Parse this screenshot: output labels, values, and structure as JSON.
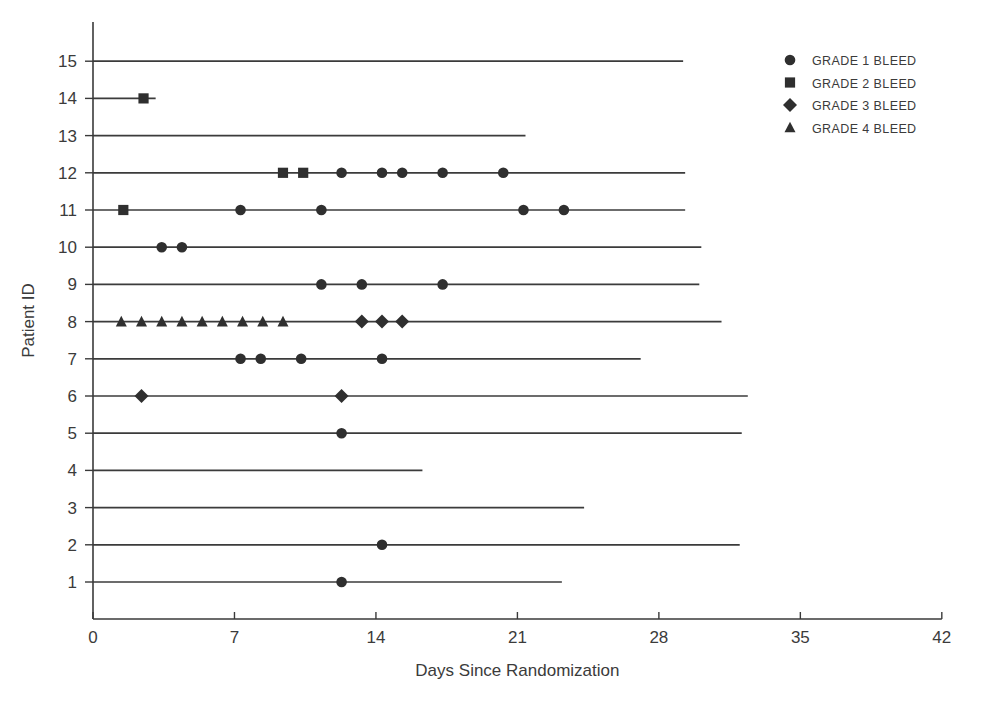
{
  "chart_data": {
    "type": "scatter",
    "title": "",
    "xlabel": "Days Since Randomization",
    "ylabel": "Patient ID",
    "xlim": [
      0,
      42
    ],
    "ylim": [
      0.5,
      15.5
    ],
    "xticks": [
      0,
      7,
      14,
      21,
      28,
      35,
      42
    ],
    "xtick_labels": [
      "0",
      "7",
      "14",
      "21",
      "28",
      "35",
      "42"
    ],
    "yticks": [
      1,
      2,
      3,
      4,
      5,
      6,
      7,
      8,
      9,
      10,
      11,
      12,
      13,
      14,
      15
    ],
    "ytick_labels": [
      "1",
      "2",
      "3",
      "4",
      "5",
      "6",
      "7",
      "8",
      "9",
      "10",
      "11",
      "12",
      "13",
      "14",
      "15"
    ],
    "grid": false,
    "legend_position": "top-right",
    "legend": [
      {
        "label": "GRADE 1 BLEED",
        "marker": "circle"
      },
      {
        "label": "GRADE 2 BLEED",
        "marker": "square"
      },
      {
        "label": "GRADE 3 BLEED",
        "marker": "diamond"
      },
      {
        "label": "GRADE 4 BLEED",
        "marker": "triangle"
      }
    ],
    "series": [
      {
        "name": "Patient 15",
        "patient_id": 15,
        "follow_up_start": 0,
        "follow_up_end": 29.2,
        "events": []
      },
      {
        "name": "Patient 14",
        "patient_id": 14,
        "follow_up_start": 0,
        "follow_up_end": 3.1,
        "events": [
          {
            "day": 2.5,
            "marker": "square",
            "grade": 2
          }
        ]
      },
      {
        "name": "Patient 13",
        "patient_id": 13,
        "follow_up_start": 0,
        "follow_up_end": 21.4,
        "events": []
      },
      {
        "name": "Patient 12",
        "patient_id": 12,
        "follow_up_start": 0,
        "follow_up_end": 29.3,
        "events": [
          {
            "day": 9.4,
            "marker": "square",
            "grade": 2
          },
          {
            "day": 10.4,
            "marker": "square",
            "grade": 2
          },
          {
            "day": 12.3,
            "marker": "circle",
            "grade": 1
          },
          {
            "day": 14.3,
            "marker": "circle",
            "grade": 1
          },
          {
            "day": 15.3,
            "marker": "circle",
            "grade": 1
          },
          {
            "day": 17.3,
            "marker": "circle",
            "grade": 1
          },
          {
            "day": 20.3,
            "marker": "circle",
            "grade": 1
          }
        ]
      },
      {
        "name": "Patient 11",
        "patient_id": 11,
        "follow_up_start": 0,
        "follow_up_end": 29.3,
        "events": [
          {
            "day": 1.5,
            "marker": "square",
            "grade": 2
          },
          {
            "day": 7.3,
            "marker": "circle",
            "grade": 1
          },
          {
            "day": 11.3,
            "marker": "circle",
            "grade": 1
          },
          {
            "day": 21.3,
            "marker": "circle",
            "grade": 1
          },
          {
            "day": 23.3,
            "marker": "circle",
            "grade": 1
          }
        ]
      },
      {
        "name": "Patient 10",
        "patient_id": 10,
        "follow_up_start": 0,
        "follow_up_end": 30.1,
        "events": [
          {
            "day": 3.4,
            "marker": "circle",
            "grade": 1
          },
          {
            "day": 4.4,
            "marker": "circle",
            "grade": 1
          }
        ]
      },
      {
        "name": "Patient 9",
        "patient_id": 9,
        "follow_up_start": 0,
        "follow_up_end": 30.0,
        "events": [
          {
            "day": 11.3,
            "marker": "circle",
            "grade": 1
          },
          {
            "day": 13.3,
            "marker": "circle",
            "grade": 1
          },
          {
            "day": 17.3,
            "marker": "circle",
            "grade": 1
          }
        ]
      },
      {
        "name": "Patient 8",
        "patient_id": 8,
        "follow_up_start": 0,
        "follow_up_end": 31.1,
        "events": [
          {
            "day": 1.4,
            "marker": "triangle",
            "grade": 4
          },
          {
            "day": 2.4,
            "marker": "triangle",
            "grade": 4
          },
          {
            "day": 3.4,
            "marker": "triangle",
            "grade": 4
          },
          {
            "day": 4.4,
            "marker": "triangle",
            "grade": 4
          },
          {
            "day": 5.4,
            "marker": "triangle",
            "grade": 4
          },
          {
            "day": 6.4,
            "marker": "triangle",
            "grade": 4
          },
          {
            "day": 7.4,
            "marker": "triangle",
            "grade": 4
          },
          {
            "day": 8.4,
            "marker": "triangle",
            "grade": 4
          },
          {
            "day": 9.4,
            "marker": "triangle",
            "grade": 4
          },
          {
            "day": 13.3,
            "marker": "diamond",
            "grade": 3
          },
          {
            "day": 14.3,
            "marker": "diamond",
            "grade": 3
          },
          {
            "day": 15.3,
            "marker": "diamond",
            "grade": 3
          }
        ]
      },
      {
        "name": "Patient 7",
        "patient_id": 7,
        "follow_up_start": 0,
        "follow_up_end": 27.1,
        "events": [
          {
            "day": 7.3,
            "marker": "circle",
            "grade": 1
          },
          {
            "day": 8.3,
            "marker": "circle",
            "grade": 1
          },
          {
            "day": 10.3,
            "marker": "circle",
            "grade": 1
          },
          {
            "day": 14.3,
            "marker": "circle",
            "grade": 1
          }
        ]
      },
      {
        "name": "Patient 6",
        "patient_id": 6,
        "follow_up_start": 0,
        "follow_up_end": 32.4,
        "events": [
          {
            "day": 2.4,
            "marker": "diamond",
            "grade": 3
          },
          {
            "day": 12.3,
            "marker": "diamond",
            "grade": 3
          }
        ]
      },
      {
        "name": "Patient 5",
        "patient_id": 5,
        "follow_up_start": 0,
        "follow_up_end": 32.1,
        "events": [
          {
            "day": 12.3,
            "marker": "circle",
            "grade": 1
          }
        ]
      },
      {
        "name": "Patient 4",
        "patient_id": 4,
        "follow_up_start": 0,
        "follow_up_end": 16.3,
        "events": []
      },
      {
        "name": "Patient 3",
        "patient_id": 3,
        "follow_up_start": 0,
        "follow_up_end": 24.3,
        "events": []
      },
      {
        "name": "Patient 2",
        "patient_id": 2,
        "follow_up_start": 0,
        "follow_up_end": 32.0,
        "events": [
          {
            "day": 14.3,
            "marker": "circle",
            "grade": 1
          }
        ]
      },
      {
        "name": "Patient 1",
        "patient_id": 1,
        "follow_up_start": 0,
        "follow_up_end": 23.2,
        "events": [
          {
            "day": 12.3,
            "marker": "circle",
            "grade": 1
          }
        ]
      }
    ]
  },
  "colors": {
    "marker": "#2f2f2f",
    "line": "#3b3b3b",
    "axis": "#3a3a3a",
    "background": "#ffffff"
  }
}
